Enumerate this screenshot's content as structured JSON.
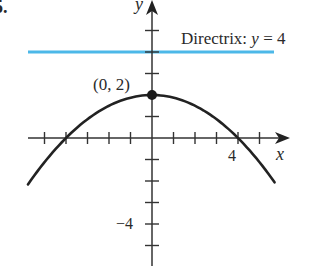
{
  "problem_number": "5.",
  "axes": {
    "x_label": "x",
    "y_label": "y",
    "x_tick_label": "4",
    "y_tick_label": "−4",
    "x_range": [
      -6,
      6.5
    ],
    "y_range": [
      -6,
      6.5
    ],
    "tick_spacing": 1
  },
  "directrix": {
    "label_prefix": "Directrix: ",
    "label_var": "y",
    "label_suffix": " = 4",
    "y_value": 4,
    "color": "#4cb8e8"
  },
  "vertex": {
    "label": "(0, 2)",
    "x": 0,
    "y": 2
  },
  "parabola": {
    "equation": "x^2 = -8(y - 2)",
    "x_min": -5.77,
    "x_max": 5.7,
    "color": "#222222"
  },
  "chart_data": {
    "type": "line",
    "title": "",
    "xlabel": "x",
    "ylabel": "y",
    "series": [
      {
        "name": "parabola",
        "x": [
          -5.77,
          -5,
          -4,
          -3,
          -2,
          -1,
          0,
          1,
          2,
          3,
          4,
          5,
          5.7
        ],
        "values": [
          -2.16,
          -1.125,
          0,
          0.875,
          1.5,
          1.875,
          2,
          1.875,
          1.5,
          0.875,
          0,
          -1.125,
          -2.06
        ]
      },
      {
        "name": "Directrix: y = 4",
        "x": [
          -5.77,
          5.7
        ],
        "values": [
          4,
          4
        ]
      }
    ],
    "annotations": [
      {
        "text": "(0, 2)",
        "x": 0,
        "y": 2
      },
      {
        "text": "Directrix: y = 4",
        "x": 3,
        "y": 4
      }
    ],
    "x_ticks": [
      -5,
      -4,
      -3,
      -2,
      -1,
      1,
      2,
      3,
      4,
      5
    ],
    "y_ticks": [
      -5,
      -4,
      -3,
      -2,
      -1,
      1,
      2,
      3,
      4,
      5
    ],
    "labeled_ticks": {
      "x": [
        4
      ],
      "y": [
        -4
      ]
    },
    "grid": false
  }
}
